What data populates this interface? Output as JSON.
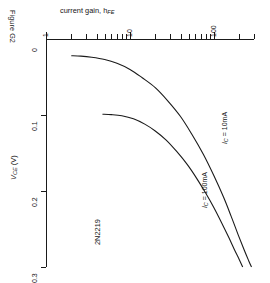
{
  "figure": {
    "caption": "Figure G2",
    "device_label": "2N2219"
  },
  "chart_data": {
    "type": "line",
    "title": "current gain, h",
    "title_sub": "FE",
    "title_full": "current gain, hFE",
    "xlabel": "current gain, hFE",
    "ylabel": "VCE (V)",
    "ylabel_main": "V",
    "ylabel_sub": "CE",
    "ylabel_unit": " (V)",
    "xscale": "log",
    "yscale": "linear",
    "xlim": [
      1,
      300
    ],
    "ylim": [
      0,
      0.3
    ],
    "y_inverted": true,
    "grid": false,
    "legend": "inline-annotations",
    "x_tick_labels": [
      "1",
      "10",
      "100"
    ],
    "x_tick_values": [
      1,
      10,
      100
    ],
    "x_minor_ticks": [
      2,
      3,
      4,
      5,
      6,
      7,
      8,
      9,
      20,
      30,
      40,
      50,
      60,
      70,
      80,
      90,
      200,
      300
    ],
    "y_tick_labels": [
      "0",
      "0.1",
      "0.2",
      "0.3"
    ],
    "y_tick_values": [
      0,
      0.1,
      0.2,
      0.3
    ],
    "series": [
      {
        "name": "IC = 10mA",
        "label_main": "I",
        "label_sub": "C",
        "label_rest": " = 10mA",
        "points": [
          [
            2.0,
            0.022
          ],
          [
            2.6,
            0.0225
          ],
          [
            3.5,
            0.024
          ],
          [
            5.0,
            0.027
          ],
          [
            7.0,
            0.032
          ],
          [
            10.0,
            0.04
          ],
          [
            14.0,
            0.051
          ],
          [
            20.0,
            0.064
          ],
          [
            28.0,
            0.081
          ],
          [
            40.0,
            0.102
          ],
          [
            55.0,
            0.126
          ],
          [
            75.0,
            0.152
          ],
          [
            100.0,
            0.18
          ],
          [
            130.0,
            0.208
          ],
          [
            160.0,
            0.233
          ],
          [
            195.0,
            0.258
          ],
          [
            230.0,
            0.278
          ],
          [
            260.0,
            0.292
          ],
          [
            280.0,
            0.3
          ]
        ]
      },
      {
        "name": "IC = 100mA",
        "label_main": "I",
        "label_sub": "C",
        "label_rest": " = 100mA",
        "points": [
          [
            4.7,
            0.099
          ],
          [
            6.0,
            0.0995
          ],
          [
            8.0,
            0.101
          ],
          [
            11.0,
            0.105
          ],
          [
            15.0,
            0.112
          ],
          [
            20.0,
            0.121
          ],
          [
            27.0,
            0.133
          ],
          [
            36.0,
            0.148
          ],
          [
            48.0,
            0.165
          ],
          [
            62.0,
            0.183
          ],
          [
            80.0,
            0.203
          ],
          [
            100.0,
            0.222
          ],
          [
            125.0,
            0.243
          ],
          [
            150.0,
            0.261
          ],
          [
            175.0,
            0.277
          ],
          [
            200.0,
            0.29
          ],
          [
            220.0,
            0.3
          ]
        ]
      }
    ],
    "annotations": [
      {
        "name": "curve-label-10ma",
        "text": "IC = 10mA"
      },
      {
        "name": "curve-label-100ma",
        "text": "IC = 100mA"
      },
      {
        "name": "device-label",
        "text": "2N2219"
      }
    ]
  },
  "colors": {
    "ink": "#1a1a1a",
    "background": "#ffffff"
  }
}
